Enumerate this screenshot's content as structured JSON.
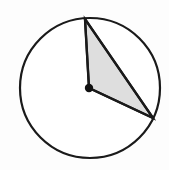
{
  "figure": {
    "background_color": "#fdfdfd",
    "stroke_color": "#1a1a1a",
    "shaded_fill_color": "#dedede",
    "circle_fill_color": "#ffffff",
    "width": 169,
    "height": 170,
    "circle": {
      "label": "circle",
      "center_x": 90,
      "center_y": 88,
      "radius": 70,
      "stroke_width": 2.2
    },
    "center_point": {
      "label": "center-point",
      "x": 89,
      "y": 88,
      "radius": 4.2
    },
    "triangle": {
      "label": "shaded-triangle",
      "stroke_width": 2.2,
      "points": "85,19 89,88 153,118",
      "vertices": [
        {
          "name": "apex-on-circle",
          "x": 85,
          "y": 19
        },
        {
          "name": "center-vertex",
          "x": 89,
          "y": 88
        },
        {
          "name": "right-on-circle",
          "x": 153,
          "y": 118
        }
      ]
    },
    "segments": [
      {
        "name": "radius-to-apex",
        "x1": 89,
        "y1": 88,
        "x2": 85,
        "y2": 19
      },
      {
        "name": "chord-apex-to-right",
        "x1": 85,
        "y1": 19,
        "x2": 153,
        "y2": 118
      },
      {
        "name": "radius-to-right",
        "x1": 89,
        "y1": 88,
        "x2": 153,
        "y2": 118
      }
    ]
  }
}
